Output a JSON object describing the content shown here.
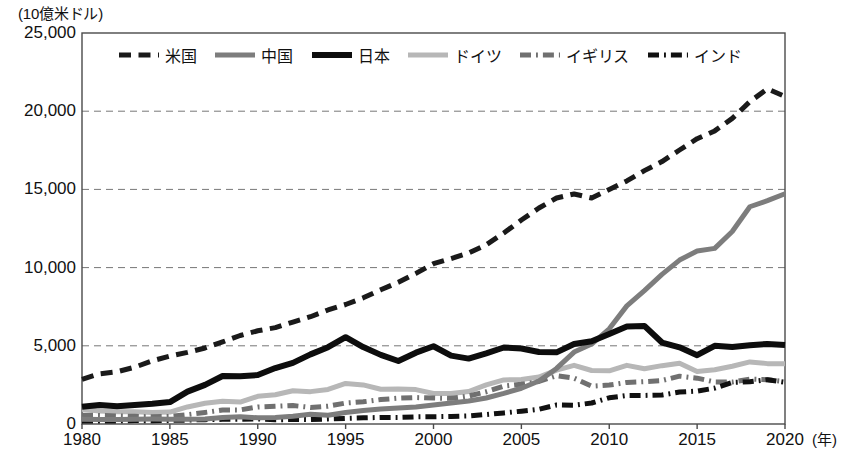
{
  "chart_data": {
    "type": "line",
    "title": "",
    "unit_label": "(10億米ドル)",
    "xlabel": "(年)",
    "ylabel": "",
    "xlim": [
      1980,
      2020
    ],
    "ylim": [
      0,
      25000
    ],
    "grid": true,
    "legend_position": "top-inside",
    "y_ticks": [
      "0",
      "5,000",
      "10,000",
      "15,000",
      "20,000",
      "25,000"
    ],
    "y_tick_values": [
      0,
      5000,
      10000,
      15000,
      20000,
      25000
    ],
    "x_ticks": [
      "1980",
      "1985",
      "1990",
      "1995",
      "2000",
      "2005",
      "2010",
      "2015",
      "2020"
    ],
    "x_tick_values": [
      1980,
      1985,
      1990,
      1995,
      2000,
      2005,
      2010,
      2015,
      2020
    ],
    "x": [
      1980,
      1981,
      1982,
      1983,
      1984,
      1985,
      1986,
      1987,
      1988,
      1989,
      1990,
      1991,
      1992,
      1993,
      1994,
      1995,
      1996,
      1997,
      1998,
      1999,
      2000,
      2001,
      2002,
      2003,
      2004,
      2005,
      2006,
      2007,
      2008,
      2009,
      2010,
      2011,
      2012,
      2013,
      2014,
      2015,
      2016,
      2017,
      2018,
      2019,
      2020
    ],
    "series": [
      {
        "name": "米国",
        "color": "#1a1a1a",
        "style": "dashed",
        "width": 5,
        "values": [
          2860,
          3210,
          3340,
          3630,
          4040,
          4340,
          4580,
          4860,
          5250,
          5660,
          5960,
          6160,
          6520,
          6860,
          7290,
          7640,
          8070,
          8580,
          9060,
          9630,
          10250,
          10580,
          10930,
          11460,
          12210,
          13040,
          13810,
          14450,
          14710,
          14450,
          14990,
          15540,
          16200,
          16780,
          17520,
          18240,
          18740,
          19540,
          20610,
          21430,
          20940
        ]
      },
      {
        "name": "中国",
        "color": "#7d7d7d",
        "style": "solid",
        "width": 5,
        "values": [
          306,
          289,
          284,
          305,
          314,
          310,
          300,
          327,
          410,
          459,
          395,
          413,
          495,
          618,
          564,
          734,
          863,
          962,
          1029,
          1094,
          1211,
          1339,
          1471,
          1660,
          1955,
          2286,
          2752,
          3552,
          4598,
          5110,
          6087,
          7552,
          8532,
          9570,
          10480,
          11060,
          11230,
          12310,
          13890,
          14280,
          14720
        ]
      },
      {
        "name": "日本",
        "color": "#0d0d0d",
        "style": "solid",
        "width": 6,
        "values": [
          1100,
          1220,
          1140,
          1210,
          1290,
          1400,
          2070,
          2500,
          3070,
          3050,
          3130,
          3580,
          3910,
          4450,
          4910,
          5550,
          4920,
          4420,
          4030,
          4560,
          4970,
          4370,
          4180,
          4520,
          4890,
          4830,
          4600,
          4580,
          5110,
          5290,
          5760,
          6230,
          6270,
          5210,
          4900,
          4400,
          5000,
          4930,
          5040,
          5120,
          5050
        ]
      },
      {
        "name": "ドイツ",
        "color": "#b7b7b7",
        "style": "solid",
        "width": 5,
        "values": [
          950,
          830,
          790,
          790,
          740,
          760,
          1090,
          1330,
          1450,
          1400,
          1770,
          1870,
          2130,
          2070,
          2210,
          2590,
          2500,
          2220,
          2240,
          2200,
          1950,
          1950,
          2080,
          2500,
          2820,
          2850,
          3000,
          3440,
          3750,
          3420,
          3400,
          3750,
          3530,
          3730,
          3890,
          3360,
          3470,
          3690,
          3970,
          3860,
          3850
        ]
      },
      {
        "name": "イギリス",
        "color": "#707070",
        "style": "dashdot",
        "width": 5,
        "values": [
          565,
          545,
          515,
          490,
          460,
          490,
          600,
          740,
          900,
          900,
          1090,
          1130,
          1180,
          1060,
          1140,
          1340,
          1420,
          1560,
          1650,
          1690,
          1660,
          1640,
          1790,
          2060,
          2420,
          2540,
          2720,
          3090,
          2930,
          2420,
          2490,
          2660,
          2710,
          2780,
          3060,
          2930,
          2690,
          2680,
          2870,
          2830,
          2710
        ]
      },
      {
        "name": "インド",
        "color": "#111111",
        "style": "dashdot",
        "width": 5,
        "values": [
          186,
          193,
          200,
          219,
          212,
          232,
          249,
          279,
          297,
          296,
          321,
          270,
          288,
          279,
          327,
          360,
          392,
          416,
          421,
          459,
          468,
          485,
          515,
          607,
          709,
          820,
          940,
          1217,
          1199,
          1342,
          1676,
          1823,
          1828,
          1857,
          2040,
          2104,
          2295,
          2653,
          2702,
          2835,
          2670
        ]
      }
    ]
  },
  "legend": {
    "items": [
      {
        "label": "米国",
        "swatch": "dashed-black"
      },
      {
        "label": "中国",
        "swatch": "solid-gray"
      },
      {
        "label": "日本",
        "swatch": "solid-black"
      },
      {
        "label": "ドイツ",
        "swatch": "solid-lightgray"
      },
      {
        "label": "イギリス",
        "swatch": "dashdot-gray"
      },
      {
        "label": "インド",
        "swatch": "dashdot-black"
      }
    ]
  },
  "plot_geometry": {
    "left": 82,
    "right": 785,
    "top": 33,
    "bottom": 424
  }
}
